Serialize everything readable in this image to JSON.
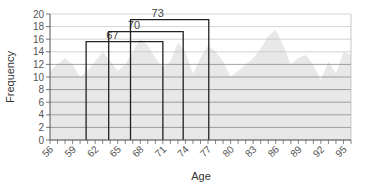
{
  "chart_data": {
    "type": "area",
    "title": "",
    "xlabel": "Age",
    "ylabel": "Frequency",
    "ylim": [
      0,
      20
    ],
    "xlim": [
      56,
      96
    ],
    "y_ticks": [
      0,
      2,
      4,
      6,
      8,
      10,
      12,
      14,
      16,
      18,
      20
    ],
    "x_tick_labels": [
      "56",
      "59",
      "62",
      "65",
      "68",
      "71",
      "74",
      "77",
      "80",
      "83",
      "86",
      "89",
      "92",
      "95"
    ],
    "grid": true,
    "legend": null,
    "series": [
      {
        "name": "Frequency",
        "x": [
          56,
          57,
          58,
          59,
          60,
          61,
          62,
          63,
          64,
          65,
          66,
          67,
          68,
          69,
          70,
          71,
          72,
          73,
          74,
          75,
          76,
          77,
          78,
          79,
          80,
          81,
          82,
          83,
          84,
          85,
          86,
          87,
          88,
          89,
          90,
          91,
          92,
          93,
          94,
          95,
          96
        ],
        "values": [
          11,
          12,
          13,
          12,
          10,
          11,
          12.5,
          14,
          12.5,
          11,
          12,
          14,
          16,
          15,
          13,
          11.5,
          12.5,
          15.5,
          14,
          10.5,
          13,
          15,
          14,
          12.5,
          10,
          11,
          12,
          13,
          14.5,
          16.5,
          17.5,
          15,
          12,
          13,
          13.5,
          12,
          9.5,
          12.5,
          10.5,
          14,
          13.5
        ],
        "color": "#e8e8e8"
      }
    ],
    "annotations": [
      {
        "label": "67",
        "x_start": 60.8,
        "x_end": 71.0,
        "height": 15.6
      },
      {
        "label": "70",
        "x_start": 63.8,
        "x_end": 73.7,
        "height": 17.2
      },
      {
        "label": "73",
        "x_start": 66.7,
        "x_end": 77.1,
        "height": 19.1
      }
    ]
  },
  "axes": {
    "x_title": "Age",
    "y_title": "Frequency"
  }
}
